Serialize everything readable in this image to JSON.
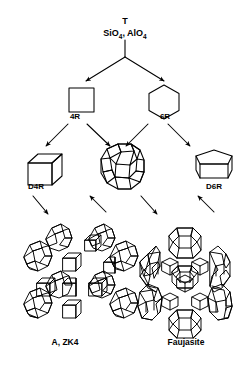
{
  "figure": {
    "type": "diagram",
    "background_color": "#ffffff",
    "line_color": "#000000"
  },
  "nodes": {
    "primary_unit": {
      "symbol": "T",
      "formula_prefix": "SiO",
      "formula_sub1": "4",
      "formula_mid": ", AlO",
      "formula_sub2": "4",
      "formula_plain": "SiO4, AlO4"
    },
    "ring_4": {
      "label": "4R",
      "shape": "square"
    },
    "ring_6": {
      "label": "6R",
      "shape": "hexagon"
    },
    "double_ring_4": {
      "label": "D4R",
      "shape": "cube"
    },
    "sodalite_cage": {
      "label": "",
      "shape": "truncated-octahedron"
    },
    "double_ring_6": {
      "label": "D6R",
      "shape": "hexagonal-prism"
    },
    "framework_a": {
      "label": "A, ZK4",
      "shape": "zeolite-a-framework"
    },
    "framework_faujasite": {
      "label": "Faujasite",
      "shape": "faujasite-framework"
    }
  },
  "arrows": [
    {
      "name": "t-to-4r",
      "from": "primary_unit",
      "to": "ring_4"
    },
    {
      "name": "t-to-6r",
      "from": "primary_unit",
      "to": "ring_6"
    },
    {
      "name": "4r-to-d4r",
      "from": "ring_4",
      "to": "double_ring_4"
    },
    {
      "name": "4r-to-cage",
      "from": "ring_4",
      "to": "sodalite_cage"
    },
    {
      "name": "6r-to-cage",
      "from": "ring_6",
      "to": "sodalite_cage"
    },
    {
      "name": "6r-to-d6r",
      "from": "ring_6",
      "to": "double_ring_6"
    },
    {
      "name": "d4r-to-framework-a",
      "from": "double_ring_4",
      "to": "framework_a"
    },
    {
      "name": "cage-to-framework-a",
      "from": "sodalite_cage",
      "to": "framework_a"
    },
    {
      "name": "cage-to-faujasite",
      "from": "sodalite_cage",
      "to": "framework_faujasite"
    },
    {
      "name": "d6r-to-faujasite",
      "from": "double_ring_6",
      "to": "framework_faujasite"
    }
  ]
}
